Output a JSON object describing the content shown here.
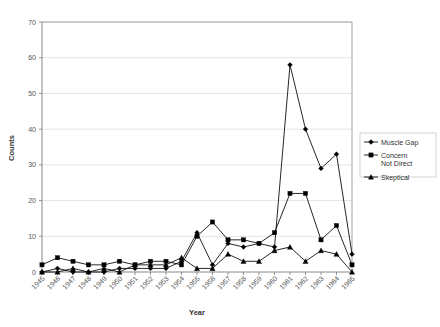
{
  "chart_data": {
    "type": "line",
    "title": "",
    "xlabel": "Year",
    "ylabel": "Counts",
    "ylim": [
      0,
      70
    ],
    "ytick_step": 10,
    "grid": true,
    "legend_position": "right",
    "categories": [
      "1945",
      "1946",
      "1947",
      "1948",
      "1949",
      "1950",
      "1951",
      "1952",
      "1953",
      "1954",
      "1955",
      "1956",
      "1957",
      "1958",
      "1959",
      "1960",
      "1961",
      "1962",
      "1963",
      "1964",
      "1965"
    ],
    "yticks": [
      0,
      10,
      20,
      30,
      40,
      50,
      60,
      70
    ],
    "series": [
      {
        "name": "Muscle Gap",
        "marker": "diamond",
        "values": [
          0,
          1,
          0,
          0,
          0,
          1,
          1,
          1,
          1,
          3,
          11,
          2,
          8,
          7,
          8,
          7,
          58,
          40,
          29,
          33,
          5
        ]
      },
      {
        "name": "Concern Not Direct",
        "marker": "square",
        "values": [
          2,
          4,
          3,
          2,
          2,
          3,
          2,
          3,
          3,
          2,
          10,
          14,
          9,
          9,
          8,
          11,
          22,
          22,
          9,
          13,
          2
        ]
      },
      {
        "name": "Skeptical",
        "marker": "triangle",
        "values": [
          0,
          0,
          1,
          0,
          1,
          0,
          2,
          2,
          2,
          4,
          1,
          1,
          5,
          3,
          3,
          6,
          7,
          3,
          6,
          5,
          0
        ]
      }
    ]
  },
  "legend": {
    "entries": [
      {
        "label": "Muscle Gap",
        "label2": ""
      },
      {
        "label": "Concern",
        "label2": "Not Direct"
      },
      {
        "label": "Skeptical",
        "label2": ""
      }
    ]
  },
  "axis": {
    "y_title": "Counts",
    "x_title": "Year"
  }
}
